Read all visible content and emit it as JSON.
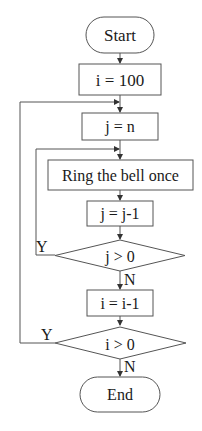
{
  "diagram": {
    "type": "flowchart",
    "nodes": {
      "start": "Start",
      "init_i": "i = 100",
      "init_j": "j = n",
      "ring": "Ring the bell once",
      "dec_j": "j = j-1",
      "cond_j": "j > 0",
      "dec_i": "i = i-1",
      "cond_i": "i > 0",
      "end": "End"
    },
    "branch_labels": {
      "cond_j_yes": "Y",
      "cond_j_no": "N",
      "cond_i_yes": "Y",
      "cond_i_no": "N"
    },
    "colors": {
      "stroke": "#555555",
      "text": "#1a1a1a",
      "background": "#ffffff"
    }
  }
}
